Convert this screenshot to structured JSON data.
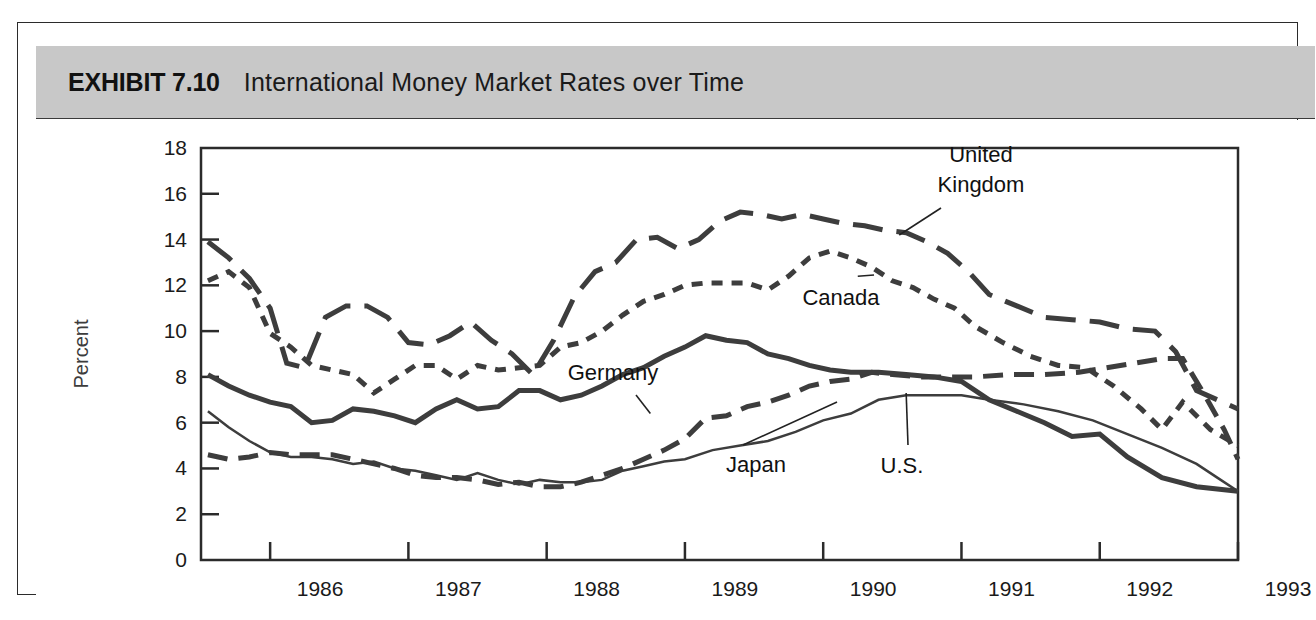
{
  "exhibit": {
    "number_label": "EXHIBIT 7.10",
    "title": "International Money Market Rates over Time"
  },
  "colors": {
    "header_band": "#c8c8c8",
    "frame": "#2b2b2b",
    "series_line": "#3d3d3d",
    "text": "#1a1a1a",
    "plot_background": "#ffffff"
  },
  "chart_data": {
    "type": "line",
    "title": "International Money Market Rates over Time",
    "xlabel": "",
    "ylabel": "Percent",
    "ylim": [
      0,
      18
    ],
    "yticks": [
      0,
      2,
      4,
      6,
      8,
      10,
      12,
      14,
      16,
      18
    ],
    "ytick_labels": [
      "0",
      "2",
      "4",
      "6",
      "8",
      "10",
      "12",
      "14",
      "16",
      "18"
    ],
    "xlim": [
      1985.5,
      1993.0
    ],
    "xticks": [
      1986,
      1987,
      1988,
      1989,
      1990,
      1991,
      1992,
      1993
    ],
    "xtick_labels": [
      "1986",
      "1987",
      "1988",
      "1989",
      "1990",
      "1991",
      "1992",
      "1993"
    ],
    "grid": false,
    "legend": "inline-annotations",
    "annotations": [
      {
        "label": "United Kingdom",
        "series": "United Kingdom",
        "at_x": 1990.55,
        "at_y": 14.2
      },
      {
        "label": "Canada",
        "series": "Canada",
        "at_x": 1990.25,
        "at_y": 12.4
      },
      {
        "label": "Germany",
        "series": "Germany",
        "at_x": 1988.75,
        "at_y": 6.4
      },
      {
        "label": "Japan",
        "series": "Japan",
        "at_x": 1990.1,
        "at_y": 6.9
      },
      {
        "label": "U.S.",
        "series": "U.S.",
        "at_x": 1990.6,
        "at_y": 7.3
      }
    ],
    "series": [
      {
        "name": "United Kingdom",
        "dash_style": "long-dash",
        "line_width": 5,
        "x": [
          1985.55,
          1985.7,
          1985.85,
          1986.0,
          1986.12,
          1986.25,
          1986.4,
          1986.55,
          1986.7,
          1986.85,
          1987.0,
          1987.15,
          1987.3,
          1987.45,
          1987.6,
          1987.75,
          1987.9,
          1988.05,
          1988.2,
          1988.35,
          1988.5,
          1988.65,
          1988.8,
          1988.95,
          1989.1,
          1989.25,
          1989.4,
          1989.55,
          1989.7,
          1989.85,
          1990.0,
          1990.15,
          1990.3,
          1990.45,
          1990.6,
          1990.75,
          1990.9,
          1991.05,
          1991.2,
          1991.4,
          1991.6,
          1991.8,
          1992.0,
          1992.2,
          1992.4,
          1992.55,
          1992.7,
          1992.85,
          1993.0
        ],
        "y": [
          13.9,
          13.2,
          12.3,
          11.0,
          8.6,
          8.4,
          10.6,
          11.1,
          11.1,
          10.6,
          9.5,
          9.4,
          9.8,
          10.4,
          9.6,
          9.0,
          8.1,
          9.6,
          11.5,
          12.6,
          13.0,
          14.0,
          14.1,
          13.6,
          14.0,
          14.8,
          15.2,
          15.1,
          14.9,
          15.1,
          14.9,
          14.7,
          14.6,
          14.4,
          14.3,
          13.9,
          13.4,
          12.6,
          11.6,
          11.1,
          10.6,
          10.5,
          10.4,
          10.1,
          10.0,
          9.1,
          7.4,
          7.0,
          6.6
        ]
      },
      {
        "name": "Canada",
        "dash_style": "short-dash",
        "line_width": 5,
        "x": [
          1985.55,
          1985.7,
          1985.85,
          1986.0,
          1986.15,
          1986.3,
          1986.45,
          1986.6,
          1986.75,
          1986.9,
          1987.05,
          1987.2,
          1987.35,
          1987.5,
          1987.65,
          1987.8,
          1987.95,
          1988.1,
          1988.25,
          1988.4,
          1988.55,
          1988.7,
          1988.85,
          1989.0,
          1989.15,
          1989.3,
          1989.45,
          1989.6,
          1989.75,
          1989.9,
          1990.05,
          1990.2,
          1990.35,
          1990.5,
          1990.65,
          1990.8,
          1990.95,
          1991.1,
          1991.3,
          1991.5,
          1991.7,
          1991.9,
          1992.1,
          1992.3,
          1992.45,
          1992.6,
          1992.8,
          1993.0
        ],
        "y": [
          12.2,
          12.6,
          11.9,
          9.9,
          9.3,
          8.5,
          8.3,
          8.1,
          7.3,
          7.9,
          8.5,
          8.5,
          7.9,
          8.5,
          8.3,
          8.4,
          8.5,
          9.3,
          9.5,
          10.0,
          10.7,
          11.3,
          11.6,
          12.0,
          12.1,
          12.1,
          12.1,
          11.8,
          12.4,
          13.2,
          13.5,
          13.2,
          12.8,
          12.2,
          11.9,
          11.4,
          11.0,
          10.2,
          9.5,
          8.9,
          8.5,
          8.4,
          7.6,
          6.6,
          5.7,
          6.9,
          5.7,
          5.0
        ]
      },
      {
        "name": "Germany",
        "dash_style": "medium-dash",
        "line_width": 5,
        "x": [
          1985.55,
          1985.7,
          1985.85,
          1986.0,
          1986.15,
          1986.3,
          1986.45,
          1986.6,
          1986.75,
          1986.9,
          1987.05,
          1987.2,
          1987.35,
          1987.5,
          1987.65,
          1987.8,
          1987.95,
          1988.1,
          1988.25,
          1988.4,
          1988.55,
          1988.7,
          1988.85,
          1989.0,
          1989.15,
          1989.3,
          1989.45,
          1989.6,
          1989.75,
          1989.9,
          1990.05,
          1990.2,
          1990.35,
          1990.5,
          1990.7,
          1990.9,
          1991.1,
          1991.35,
          1991.6,
          1991.85,
          1992.05,
          1992.25,
          1992.45,
          1992.6,
          1992.75,
          1992.9,
          1993.0
        ],
        "y": [
          4.6,
          4.4,
          4.5,
          4.7,
          4.6,
          4.6,
          4.6,
          4.4,
          4.2,
          4.0,
          3.7,
          3.6,
          3.6,
          3.5,
          3.3,
          3.4,
          3.2,
          3.2,
          3.4,
          3.7,
          4.0,
          4.4,
          4.8,
          5.3,
          6.2,
          6.3,
          6.7,
          6.9,
          7.2,
          7.6,
          7.8,
          7.9,
          8.2,
          8.1,
          8.0,
          8.0,
          8.0,
          8.1,
          8.1,
          8.2,
          8.4,
          8.6,
          8.8,
          8.8,
          7.3,
          5.7,
          4.4
        ]
      },
      {
        "name": "Japan",
        "dash_style": "solid-thin",
        "line_width": 2.5,
        "x": [
          1985.55,
          1985.7,
          1985.85,
          1986.0,
          1986.15,
          1986.3,
          1986.45,
          1986.6,
          1986.75,
          1986.9,
          1987.05,
          1987.2,
          1987.35,
          1987.5,
          1987.65,
          1987.8,
          1987.95,
          1988.1,
          1988.25,
          1988.4,
          1988.55,
          1988.7,
          1988.85,
          1989.0,
          1989.2,
          1989.4,
          1989.6,
          1989.8,
          1990.0,
          1990.2,
          1990.4,
          1990.6,
          1990.8,
          1991.0,
          1991.2,
          1991.45,
          1991.7,
          1991.95,
          1992.2,
          1992.45,
          1992.7,
          1992.85,
          1993.0
        ],
        "y": [
          6.5,
          5.8,
          5.2,
          4.7,
          4.5,
          4.5,
          4.4,
          4.2,
          4.3,
          4.0,
          3.9,
          3.7,
          3.5,
          3.8,
          3.5,
          3.3,
          3.5,
          3.4,
          3.4,
          3.5,
          3.9,
          4.1,
          4.3,
          4.4,
          4.8,
          5.0,
          5.2,
          5.6,
          6.1,
          6.4,
          7.0,
          7.2,
          7.2,
          7.2,
          7.0,
          6.8,
          6.5,
          6.1,
          5.5,
          4.9,
          4.2,
          3.6,
          3.0
        ]
      },
      {
        "name": "U.S.",
        "dash_style": "solid-thick",
        "line_width": 5,
        "x": [
          1985.55,
          1985.7,
          1985.85,
          1986.0,
          1986.15,
          1986.3,
          1986.45,
          1986.6,
          1986.75,
          1986.9,
          1987.05,
          1987.2,
          1987.35,
          1987.5,
          1987.65,
          1987.8,
          1987.95,
          1988.1,
          1988.25,
          1988.4,
          1988.55,
          1988.7,
          1988.85,
          1989.0,
          1989.15,
          1989.3,
          1989.45,
          1989.6,
          1989.75,
          1989.9,
          1990.05,
          1990.2,
          1990.4,
          1990.6,
          1990.8,
          1991.0,
          1991.2,
          1991.4,
          1991.6,
          1991.8,
          1992.0,
          1992.2,
          1992.45,
          1992.7,
          1993.0
        ],
        "y": [
          8.1,
          7.6,
          7.2,
          6.9,
          6.7,
          6.0,
          6.1,
          6.6,
          6.5,
          6.3,
          6.0,
          6.6,
          7.0,
          6.6,
          6.7,
          7.4,
          7.4,
          7.0,
          7.2,
          7.6,
          8.1,
          8.4,
          8.9,
          9.3,
          9.8,
          9.6,
          9.5,
          9.0,
          8.8,
          8.5,
          8.3,
          8.2,
          8.2,
          8.1,
          8.0,
          7.8,
          7.0,
          6.5,
          6.0,
          5.4,
          5.5,
          4.5,
          3.6,
          3.2,
          3.0
        ]
      }
    ]
  }
}
